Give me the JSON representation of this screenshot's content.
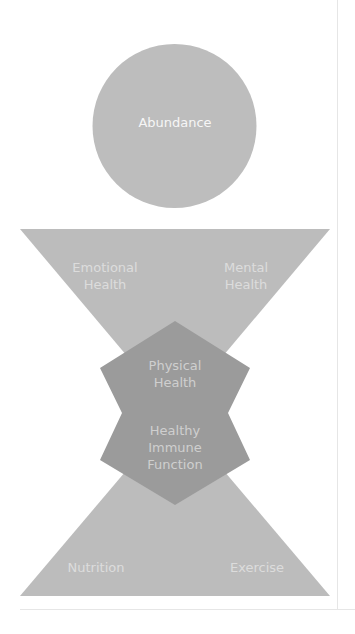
{
  "colors": {
    "light_shape": "#bcbcbc",
    "dark_shape": "#9b9b9b",
    "circle": "#bdbdbd",
    "label_on_light": "#dcdcdc",
    "label_on_dark": "#cfcfcf",
    "circle_label": "#f6f6f6",
    "divider": "#e6e6e6"
  },
  "diagram": {
    "top": {
      "label": "Abundance"
    },
    "upper_triangle": {
      "left_label_line1": "Emotional",
      "left_label_line2": "Health",
      "right_label_line1": "Mental",
      "right_label_line2": "Health"
    },
    "center": {
      "upper_label_line1": "Physical",
      "upper_label_line2": "Health",
      "lower_label_line1": "Healthy",
      "lower_label_line2": "Immune",
      "lower_label_line3": "Function"
    },
    "lower_triangle": {
      "left_label": "Nutrition",
      "right_label": "Exercise"
    }
  }
}
